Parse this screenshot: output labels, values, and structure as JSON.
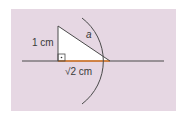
{
  "diagram": {
    "background_color": "#e6d7e3",
    "triangle_fill": "#ffffff",
    "line_color": "#4a4a4a",
    "highlight_color": "#e07b2a",
    "labels": {
      "vertical_leg": "1 cm",
      "hypotenuse": "a",
      "horizontal_leg_radical": "√2",
      "horizontal_leg_unit": " cm"
    },
    "elements": {
      "horizontal_line": "number line",
      "right_angle_marker": "right-angle-with-dot",
      "arc": "circle arc centered at right angle vertex through triangle end"
    }
  }
}
